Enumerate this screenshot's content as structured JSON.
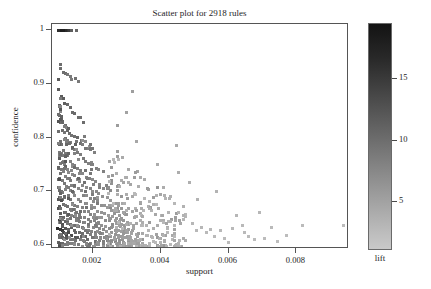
{
  "chart_data": {
    "type": "scatter",
    "title": "Scatter plot for 2918 rules",
    "xlabel": "support",
    "ylabel": "confidence",
    "xlim": [
      0.0008,
      0.00955
    ],
    "ylim": [
      0.592,
      1.012
    ],
    "xticks": [
      0.002,
      0.004,
      0.006,
      0.008
    ],
    "xtick_labels": [
      "0.002",
      "0.004",
      "0.006",
      "0.008"
    ],
    "yticks": [
      0.6,
      0.7,
      0.8,
      0.9,
      1.0
    ],
    "ytick_labels": [
      "0.6",
      "0.7",
      "0.8",
      "0.9",
      "1"
    ],
    "grid": false,
    "n_points": 2918,
    "colorbar": {
      "label": "lift",
      "ticks": [
        5,
        10,
        15
      ],
      "tick_labels": [
        "5",
        "10",
        "15"
      ],
      "range": [
        1.0,
        19.5
      ],
      "position": "right",
      "colormap": "grayscale-reversed-dark-high",
      "color_high": "#131313",
      "color_low": "#c9c9c9"
    },
    "series": [
      {
        "name": "rules",
        "encoding": {
          "x": "support",
          "y": "confidence",
          "color": "lift"
        },
        "marker": "square",
        "marker_size_px": 3,
        "description": "Association rules; dense arc-shaped bands of points at low support (0.001-0.003) spanning confidence 0.6-0.94, a horizontal band of points at confidence = 1 near support 0.001-0.0016, and a sparse low-lift tail extending to support 0.0094 at confidence 0.60-0.70."
      }
    ],
    "annotations": [
      {
        "text": "confidence = 1 band",
        "x": 0.00115,
        "y": 1.0
      },
      {
        "text": "darkest (highest lift) points",
        "x": 0.00145,
        "y": 0.632
      }
    ]
  },
  "axes": {
    "x_title": "support",
    "y_title": "confidence"
  },
  "colors": {
    "frame": "#555555",
    "text": "#1d1d1d",
    "background": "#ffffff"
  }
}
